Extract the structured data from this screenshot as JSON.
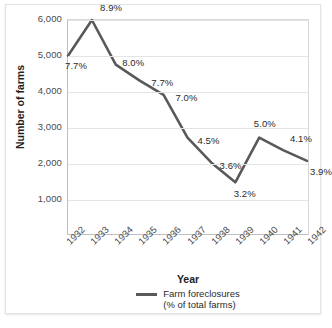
{
  "chart_data": {
    "type": "line",
    "title": "",
    "xlabel": "Year",
    "ylabel": "Number of farms",
    "categories": [
      "1932",
      "1933",
      "1934",
      "1935",
      "1936",
      "1937",
      "1938",
      "1939",
      "1940",
      "1941",
      "1942"
    ],
    "values": [
      5000,
      6000,
      4750,
      4300,
      3900,
      2700,
      2000,
      1450,
      2700,
      2350,
      2050
    ],
    "point_labels": [
      "7.7%",
      "8.9%",
      "8.0%",
      "7.7%",
      "7.0%",
      "4.5%",
      "3.6%",
      "3.2%",
      "5.0%",
      "4.1%",
      "3.9%"
    ],
    "ylim": [
      0,
      6000
    ],
    "yticks": [
      1000,
      2000,
      3000,
      4000,
      5000,
      6000
    ],
    "ytick_labels": [
      "1,000",
      "2,000",
      "3,000",
      "4,000",
      "5,000",
      "6,000"
    ],
    "grid": true,
    "legend_position": "bottom",
    "series": [
      {
        "name": "Farm foreclosures (% of total farms)",
        "color": "#595959",
        "values": [
          5000,
          6000,
          4750,
          4300,
          3900,
          2700,
          2000,
          1450,
          2700,
          2350,
          2050
        ]
      }
    ],
    "legend": {
      "line1": "Farm foreclosures",
      "line2": "(% of total farms)",
      "swatch_color": "#595959"
    }
  },
  "axis": {
    "y_title": "Number of farms",
    "x_title": "Year"
  },
  "colors": {
    "line": "#595959",
    "grid": "#e4e4e4",
    "axis": "#bfbfbf",
    "text": "#4a4a4a",
    "card_border": "#e3e3e3",
    "background": "#ffffff"
  }
}
